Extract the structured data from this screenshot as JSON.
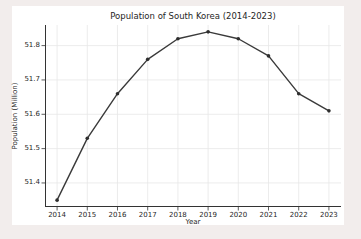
{
  "colors": {
    "page_background": "#f2edec",
    "figure_background": "#ffffff",
    "line": "#3a3a3a",
    "marker": "#2e2e2e",
    "grid": "#e7e7e7",
    "spine": "#333333",
    "text": "#262626"
  },
  "chart_data": {
    "type": "line",
    "title": "Population of South Korea (2014-2023)",
    "xlabel": "Year",
    "ylabel": "Population (Million)",
    "categories": [
      2014,
      2015,
      2016,
      2017,
      2018,
      2019,
      2020,
      2021,
      2022,
      2023
    ],
    "series": [
      {
        "name": "Population",
        "values": [
          51.35,
          51.53,
          51.66,
          51.76,
          51.82,
          51.84,
          51.82,
          51.77,
          51.66,
          51.61
        ]
      }
    ],
    "xlim": [
      2013.6,
      2023.4
    ],
    "ylim": [
      51.33,
      51.86
    ],
    "x_tick_labels": [
      "2014",
      "2015",
      "2016",
      "2017",
      "2018",
      "2019",
      "2020",
      "2021",
      "2022",
      "2023"
    ],
    "y_ticks": [
      51.4,
      51.5,
      51.6,
      51.7,
      51.8
    ],
    "y_tick_labels": [
      "51.4",
      "51.5",
      "51.6",
      "51.7",
      "51.8"
    ],
    "grid": true,
    "legend_position": "none",
    "marker_shape": "circle"
  }
}
